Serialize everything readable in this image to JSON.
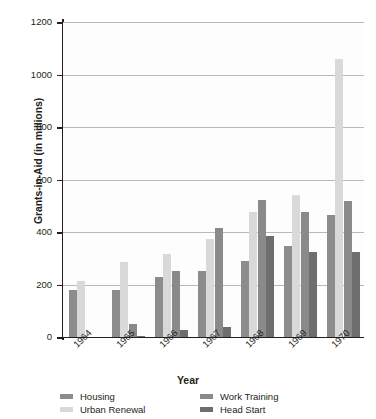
{
  "chart_data": {
    "type": "bar",
    "title": "",
    "xlabel": "Year",
    "ylabel": "Grants-in-Aid (in millions)",
    "categories": [
      "1964",
      "1965",
      "1966",
      "1967",
      "1968",
      "1969",
      "1970"
    ],
    "ylim": [
      0,
      1200
    ],
    "yticks": [
      0,
      200,
      400,
      600,
      800,
      1000,
      1200
    ],
    "ytick_labels": [
      "0",
      "200",
      "400",
      "600",
      "800",
      "1000",
      "1200"
    ],
    "grid": true,
    "legend_position": "bottom",
    "series": [
      {
        "name": "Housing",
        "color": "#8c8c8c",
        "values": [
          180,
          180,
          228,
          250,
          288,
          348,
          465
        ]
      },
      {
        "name": "Urban Renewal",
        "color": "#d9d9d9",
        "values": [
          212,
          285,
          315,
          375,
          478,
          540,
          1058
        ]
      },
      {
        "name": "Work Training",
        "color": "#8a8a8a",
        "values": [
          0,
          48,
          252,
          415,
          522,
          475,
          520
        ]
      },
      {
        "name": "Head Start",
        "color": "#6e6e6e",
        "values": [
          0,
          5,
          26,
          40,
          383,
          323,
          322
        ]
      }
    ]
  },
  "legend": {
    "items": [
      {
        "label": "Housing",
        "key": "housing"
      },
      {
        "label": "Work Training",
        "key": "work-training"
      },
      {
        "label": "Urban Renewal",
        "key": "urban-renewal"
      },
      {
        "label": "Head Start",
        "key": "head-start"
      }
    ]
  },
  "colors": {
    "axis": "#231f20",
    "gridline": "#b9b9b9",
    "background": "#ffffff"
  }
}
